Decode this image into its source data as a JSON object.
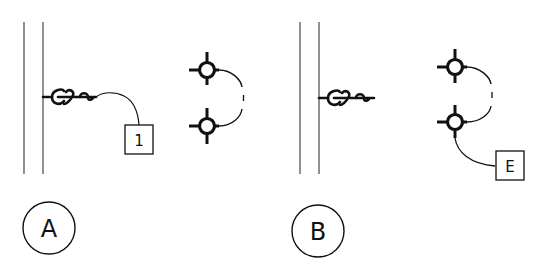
{
  "diagram": {
    "panels": [
      {
        "id": "A",
        "label": "A",
        "tag": "1"
      },
      {
        "id": "B",
        "label": "B",
        "tag": "E"
      }
    ]
  },
  "colors": {
    "stroke": "#111111",
    "wall": "#555555",
    "background": "#ffffff"
  }
}
